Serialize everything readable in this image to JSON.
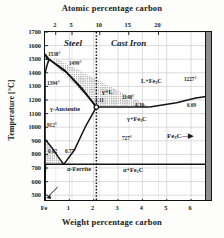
{
  "figure": {
    "type": "phase-diagram",
    "top_axis_title": "Atomic percentage carbon",
    "bottom_axis_title": "Weight percentage carbon",
    "y_axis_title": "Temperature [°C]"
  },
  "axes": {
    "y_ticks": [
      "1700",
      "1600",
      "1500",
      "1400",
      "1300",
      "1200",
      "1100",
      "1000",
      "900",
      "800",
      "700",
      "600",
      "500"
    ],
    "y_min": 450,
    "y_max": 1700,
    "x_ticks": [
      "Fe",
      "1",
      "2",
      "3",
      "4",
      "5",
      "6"
    ],
    "x_min": 0,
    "x_max": 6.9,
    "top_ticks": [
      "2",
      "5",
      "10",
      "15",
      "20"
    ],
    "top_tick_positions_wt": [
      0.44,
      1.11,
      2.25,
      3.44,
      4.66
    ]
  },
  "regions": [
    {
      "label": "Steel",
      "style": "italic-bold"
    },
    {
      "label": "Cast Iron",
      "style": "italic-bold"
    },
    {
      "label": "γ-Austenite",
      "style": "bold"
    },
    {
      "label": "α-Ferrite",
      "style": "bold"
    },
    {
      "label": "γ+L",
      "style": "bold"
    },
    {
      "label": "L+Fe",
      "sub": "3",
      "label_tail": "C",
      "style": "bold"
    },
    {
      "label": "γ+Fe",
      "sub": "3",
      "label_tail": "C",
      "style": "bold"
    },
    {
      "label": "α+Fe",
      "sub": "3",
      "label_tail": "C",
      "style": "bold"
    },
    {
      "label": "Fe",
      "sub": "3",
      "label_tail": "C—▶",
      "style": "bold"
    }
  ],
  "annotations": {
    "t_melt_fe": "1538°",
    "t_peritectic": "1499°",
    "t_delta_gamma": "1394°",
    "t_eutectic": "1148°",
    "t_cementite_melt": "1227°",
    "t_a3_pure_fe": "912°",
    "t_eutectoid": "727°",
    "c_austenite_max": "2.11",
    "c_eutectic": "4.30",
    "c_cementite": "6.69",
    "c_ferrite_max": "0.02",
    "c_eutectoid": "0.77"
  },
  "chart_data": {
    "type": "line",
    "xlabel": "Weight percentage carbon",
    "ylabel": "Temperature [°C]",
    "xlim": [
      0,
      6.9
    ],
    "ylim": [
      450,
      1700
    ],
    "grid": true,
    "invariant_points": [
      {
        "name": "Fe melting point",
        "wtC": 0.0,
        "tempC": 1538
      },
      {
        "name": "Peritectic",
        "wtC": 0.17,
        "tempC": 1499
      },
      {
        "name": "delta→gamma",
        "wtC": 0.0,
        "tempC": 1394
      },
      {
        "name": "Austenite max solubility",
        "wtC": 2.11,
        "tempC": 1148
      },
      {
        "name": "Eutectic",
        "wtC": 4.3,
        "tempC": 1148
      },
      {
        "name": "Cementite melting",
        "wtC": 6.69,
        "tempC": 1227
      },
      {
        "name": "A3 pure iron",
        "wtC": 0.0,
        "tempC": 912
      },
      {
        "name": "Eutectoid",
        "wtC": 0.77,
        "tempC": 727
      },
      {
        "name": "Ferrite max solubility",
        "wtC": 0.02,
        "tempC": 727
      }
    ],
    "series": [
      {
        "name": "Liquidus",
        "points": [
          [
            0,
            1538
          ],
          [
            0.17,
            1499
          ],
          [
            2.11,
            1148
          ],
          [
            4.3,
            1148
          ],
          [
            6.69,
            1227
          ]
        ]
      },
      {
        "name": "Solidus",
        "points": [
          [
            0,
            1538
          ],
          [
            0.09,
            1499
          ],
          [
            0.17,
            1499
          ],
          [
            2.11,
            1148
          ]
        ]
      },
      {
        "name": "Acm",
        "points": [
          [
            0.77,
            727
          ],
          [
            2.11,
            1148
          ]
        ]
      },
      {
        "name": "A3",
        "points": [
          [
            0,
            912
          ],
          [
            0.77,
            727
          ]
        ]
      },
      {
        "name": "Eutectoid",
        "points": [
          [
            0,
            727
          ],
          [
            6.69,
            727
          ]
        ]
      },
      {
        "name": "Solvus",
        "points": [
          [
            0,
            450
          ],
          [
            0.02,
            727
          ]
        ]
      }
    ],
    "steel_castiron_boundary_wtC": 2.11
  }
}
